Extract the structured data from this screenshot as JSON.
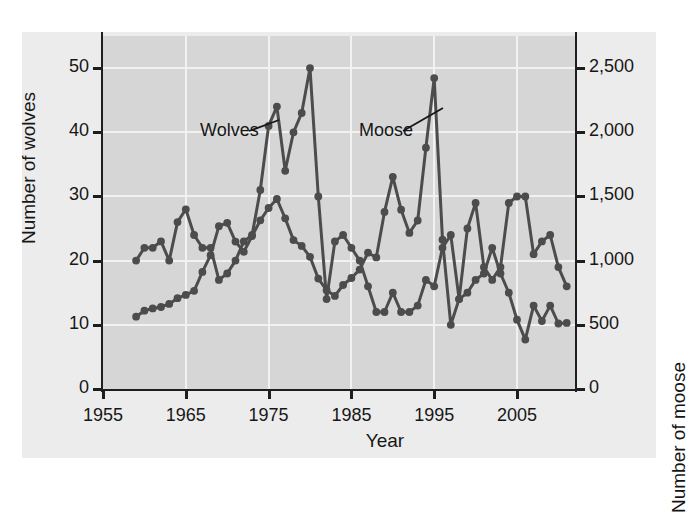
{
  "chart_data": {
    "type": "line",
    "title": "",
    "subtitle": "",
    "xlabel": "Year",
    "ylabel": "Number of wolves",
    "ylabel_right": "Number of moose",
    "xlim": [
      1955,
      2012
    ],
    "ylim": [
      0,
      55
    ],
    "ylim_right": [
      0,
      2750
    ],
    "grid": true,
    "legend": "inline-annotations",
    "x_ticks": [
      1955,
      1965,
      1975,
      1985,
      1995,
      2005
    ],
    "x_tick_labels": [
      "1955",
      "1965",
      "1975",
      "1985",
      "1995",
      "2005"
    ],
    "y_ticks_left": [
      0,
      10,
      20,
      30,
      40,
      50
    ],
    "y_tick_labels_left": [
      "0",
      "10",
      "20",
      "30",
      "40",
      "50"
    ],
    "y_ticks_right": [
      0,
      500,
      1000,
      1500,
      2000,
      2500
    ],
    "y_tick_labels_right": [
      "0",
      "500",
      "1,000",
      "1,500",
      "2,000",
      "2,500"
    ],
    "annotations": [
      {
        "text": "Wolves",
        "series": "Number of wolves"
      },
      {
        "text": "Moose",
        "series": "Number of moose"
      }
    ],
    "marker": "circle",
    "line_color": "#4a4a4a",
    "marker_color": "#4a4a4a",
    "plot_background": "#d6d6d6",
    "figure_background": "#ececec",
    "gridline_color": "#f2f2f2",
    "x": [
      1959,
      1960,
      1961,
      1962,
      1963,
      1964,
      1965,
      1966,
      1967,
      1968,
      1969,
      1970,
      1971,
      1972,
      1973,
      1974,
      1975,
      1976,
      1977,
      1978,
      1979,
      1980,
      1981,
      1982,
      1983,
      1984,
      1985,
      1986,
      1987,
      1988,
      1989,
      1990,
      1991,
      1992,
      1993,
      1994,
      1995,
      1996,
      1997,
      1998,
      1999,
      2000,
      2001,
      2002,
      2003,
      2004,
      2005,
      2006,
      2007,
      2008,
      2009,
      2010,
      2011
    ],
    "series": [
      {
        "name": "Wolves",
        "axis": "left",
        "values": [
          20,
          22,
          22,
          23,
          20,
          26,
          28,
          24,
          22,
          22,
          17,
          18,
          20,
          23,
          24,
          31,
          41,
          44,
          34,
          40,
          43,
          50,
          30,
          14,
          23,
          24,
          22,
          20,
          16,
          12,
          12,
          15,
          12,
          12,
          13,
          17,
          16,
          22,
          24,
          14,
          25,
          29,
          19,
          17,
          19,
          29,
          30,
          30,
          21,
          23,
          24,
          19,
          16
        ]
      },
      {
        "name": "Moose",
        "axis": "right",
        "values": [
          563,
          610,
          628,
          639,
          663,
          707,
          733,
          765,
          912,
          1042,
          1268,
          1295,
          1148,
          1069,
          1191,
          1314,
          1410,
          1480,
          1330,
          1160,
          1115,
          1030,
          860,
          770,
          725,
          810,
          865,
          930,
          1062,
          1025,
          1380,
          1653,
          1397,
          1216,
          1313,
          1880,
          2422,
          1163,
          500,
          700,
          750,
          850,
          900,
          1100,
          900,
          750,
          540,
          385,
          650,
          530,
          650,
          510,
          515
        ]
      }
    ]
  }
}
